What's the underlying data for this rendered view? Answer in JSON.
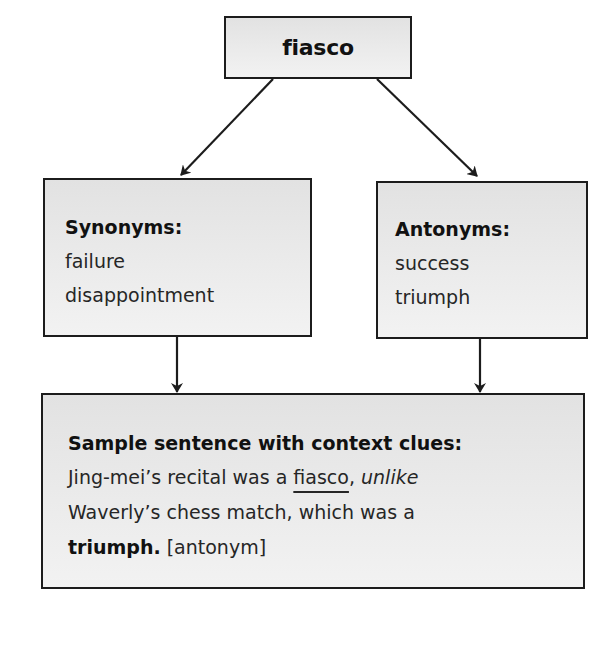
{
  "diagram": {
    "root": {
      "label": "fiasco"
    },
    "synonyms": {
      "heading": "Synonyms:",
      "items": [
        "failure",
        "disappointment"
      ]
    },
    "antonyms": {
      "heading": "Antonyms:",
      "items": [
        "success",
        "triumph"
      ]
    },
    "sample_sentence": {
      "heading": "Sample sentence with context clues:",
      "line1": {
        "part1": "Jing-mei’s recital was a ",
        "target_word": "fiasco",
        "comma": ", ",
        "clue_word": "unlike"
      },
      "line2": {
        "text": "Waverly’s chess match, which was a"
      },
      "line3": {
        "bold_word": "triumph.",
        "tag": " [antonym]"
      }
    },
    "edges": [
      {
        "from": "root",
        "to": "synonyms"
      },
      {
        "from": "root",
        "to": "antonyms"
      },
      {
        "from": "synonyms",
        "to": "sample_sentence"
      },
      {
        "from": "antonyms",
        "to": "sample_sentence"
      }
    ],
    "colors": {
      "border": "#1c1c1c",
      "box_fill": "#e8e8e8",
      "text": "#1a1a1a",
      "background": "#ffffff"
    }
  }
}
